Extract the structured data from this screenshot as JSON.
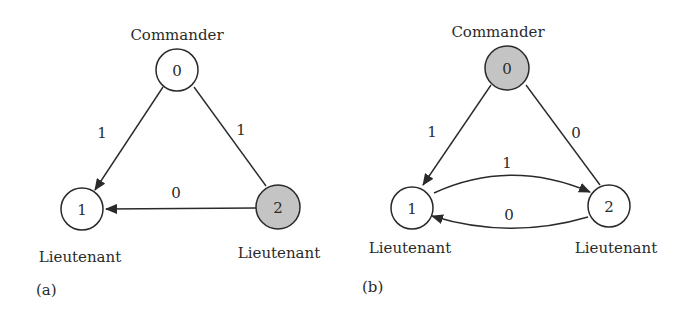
{
  "panels": [
    {
      "id": "a",
      "caption": "(a)",
      "nodes": [
        {
          "id": "0",
          "label": "0",
          "role": "Commander",
          "faulty": false
        },
        {
          "id": "1",
          "label": "1",
          "role": "Lieutenant",
          "faulty": false
        },
        {
          "id": "2",
          "label": "2",
          "role": "Lieutenant",
          "faulty": true
        }
      ],
      "edges": [
        {
          "from": "0",
          "to": "1",
          "label": "1"
        },
        {
          "from": "0",
          "to": "2",
          "label": "1"
        },
        {
          "from": "2",
          "to": "1",
          "label": "0"
        }
      ]
    },
    {
      "id": "b",
      "caption": "(b)",
      "nodes": [
        {
          "id": "0",
          "label": "0",
          "role": "Commander",
          "faulty": true
        },
        {
          "id": "1",
          "label": "1",
          "role": "Lieutenant",
          "faulty": false
        },
        {
          "id": "2",
          "label": "2",
          "role": "Lieutenant",
          "faulty": false
        }
      ],
      "edges": [
        {
          "from": "0",
          "to": "1",
          "label": "1"
        },
        {
          "from": "0",
          "to": "2",
          "label": "0"
        },
        {
          "from": "1",
          "to": "2",
          "label": "1"
        },
        {
          "from": "2",
          "to": "1",
          "label": "0"
        }
      ]
    }
  ],
  "colors": {
    "faulty_fill": "#c4c4c4",
    "normal_fill": "#ffffff",
    "stroke": "#2a2a2a"
  }
}
